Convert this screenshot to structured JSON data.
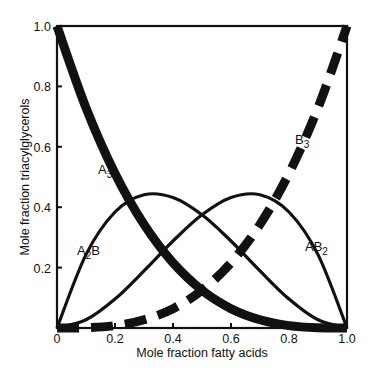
{
  "chart_data": {
    "type": "line",
    "title": "",
    "xlabel": "Mole fraction fatty acids",
    "ylabel": "Mole fraction triacylglycerols",
    "xlim": [
      0,
      1.0
    ],
    "ylim": [
      0,
      1.0
    ],
    "grid": false,
    "legend": "inline labels",
    "x_ticks": [
      "0",
      "0.2",
      "0.4",
      "0.6",
      "0.8",
      "1.0"
    ],
    "y_ticks": [
      "0.2",
      "0.4",
      "0.6",
      "0.8",
      "1.0"
    ],
    "x": [
      0,
      0.1,
      0.2,
      0.3,
      0.4,
      0.5,
      0.6,
      0.7,
      0.8,
      0.9,
      1.0
    ],
    "series": [
      {
        "name": "A3",
        "label_main": "A",
        "label_sub": "3",
        "style": "thick solid",
        "values": [
          1.0,
          0.729,
          0.512,
          0.343,
          0.216,
          0.125,
          0.064,
          0.027,
          0.008,
          0.001,
          0.0
        ]
      },
      {
        "name": "A2B",
        "label_main": "A",
        "label_mid": "2",
        "label_end": "B",
        "style": "solid",
        "values": [
          0.0,
          0.243,
          0.384,
          0.441,
          0.432,
          0.375,
          0.288,
          0.189,
          0.096,
          0.027,
          0.0
        ]
      },
      {
        "name": "AB2",
        "label_main": "AB",
        "label_sub": "2",
        "style": "solid",
        "values": [
          0.0,
          0.027,
          0.096,
          0.189,
          0.288,
          0.375,
          0.432,
          0.441,
          0.384,
          0.243,
          0.0
        ]
      },
      {
        "name": "B3",
        "label_main": "B",
        "label_sub": "3",
        "style": "thick dashed",
        "values": [
          0.0,
          0.001,
          0.008,
          0.027,
          0.064,
          0.125,
          0.216,
          0.343,
          0.512,
          0.729,
          1.0
        ]
      }
    ]
  }
}
